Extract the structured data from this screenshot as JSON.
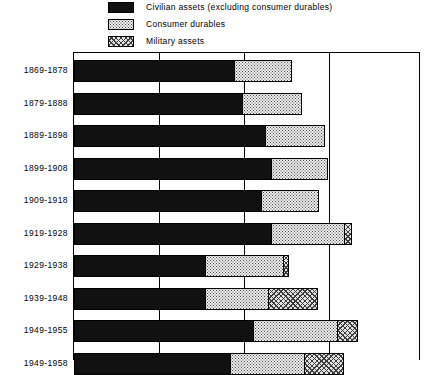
{
  "legend": {
    "items": [
      {
        "label": "Civilian assets (excluding consumer durables)",
        "pattern": "solid",
        "key": "civilian"
      },
      {
        "label": "Consumer durables",
        "pattern": "dots",
        "key": "durables"
      },
      {
        "label": "Military assets",
        "pattern": "hatch",
        "key": "military"
      }
    ]
  },
  "chart_data": {
    "type": "bar",
    "orientation": "horizontal",
    "stacked": true,
    "title": "",
    "xlabel": "",
    "ylabel": "",
    "grid": true,
    "legend_position": "top",
    "axis": {
      "gridline_values": [
        1,
        2,
        3
      ],
      "xlim": [
        0,
        4
      ],
      "gridline_count": 3
    },
    "categories": [
      "1869-1878",
      "1879-1888",
      "1889-1898",
      "1899-1908",
      "1909-1918",
      "1919-1928",
      "1929-1938",
      "1939-1948",
      "1949-1955",
      "1949-1958"
    ],
    "series": [
      {
        "name": "Civilian assets (excluding consumer durables)",
        "pattern": "solid",
        "values": [
          1.89,
          1.99,
          2.26,
          2.33,
          2.21,
          2.33,
          1.55,
          1.55,
          2.12,
          1.85
        ]
      },
      {
        "name": "Consumer durables",
        "pattern": "dots",
        "values": [
          0.69,
          0.71,
          0.71,
          0.67,
          0.69,
          0.87,
          0.93,
          0.76,
          1.0,
          0.88
        ]
      },
      {
        "name": "Military assets",
        "pattern": "hatch",
        "values": [
          0.0,
          0.0,
          0.0,
          0.0,
          0.0,
          0.09,
          0.07,
          0.59,
          0.24,
          0.47
        ]
      }
    ]
  },
  "geometry": {
    "plot_left_px": 73,
    "plot_right_px": 420,
    "plot_top_px": 52,
    "unit_px": 85,
    "bar_height_px": 22,
    "bar_pitch_px": 32.5,
    "first_bar_top_px": 7
  }
}
